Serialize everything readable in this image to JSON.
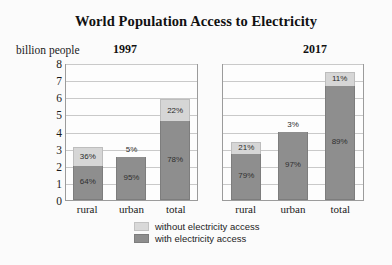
{
  "title": "World Population Access to Electricity",
  "ylabel": "billion people",
  "panels": [
    {
      "year": "1997"
    },
    {
      "year": "2017"
    }
  ],
  "legend": [
    {
      "label": "without electricity access",
      "color": "#d9d9d9"
    },
    {
      "label": "with electricity access",
      "color": "#8e8e8e"
    }
  ],
  "yticks": [
    "8",
    "7",
    "6",
    "5",
    "4",
    "3",
    "2",
    "1",
    "0"
  ],
  "categories": [
    "rural",
    "urban",
    "total"
  ],
  "labels_1997": {
    "rural_without": "36%",
    "rural_with": "64%",
    "urban_without": "5%",
    "urban_with": "95%",
    "total_without": "22%",
    "total_with": "78%"
  },
  "labels_2017": {
    "rural_without": "21%",
    "rural_with": "79%",
    "urban_without": "3%",
    "urban_with": "97%",
    "total_without": "11%",
    "total_with": "89%"
  },
  "chart_data": {
    "type": "bar",
    "subtype": "stacked",
    "title": "World Population Access to Electricity",
    "xlabel": "",
    "ylabel": "billion people",
    "ylim": [
      0,
      8
    ],
    "ytick_step": 1,
    "grid": true,
    "legend_position": "bottom-center",
    "panels": [
      {
        "name": "1997",
        "categories": [
          "rural",
          "urban",
          "total"
        ],
        "series": [
          {
            "name": "with electricity access",
            "values": [
              2.0,
              2.52,
              4.6
            ],
            "percent": [
              64,
              95,
              78
            ],
            "color": "#8e8e8e"
          },
          {
            "name": "without electricity access",
            "values": [
              1.1,
              0.13,
              1.3
            ],
            "percent": [
              36,
              5,
              22
            ],
            "color": "#d9d9d9"
          }
        ],
        "totals": [
          3.1,
          2.65,
          5.9
        ]
      },
      {
        "name": "2017",
        "categories": [
          "rural",
          "urban",
          "total"
        ],
        "series": [
          {
            "name": "with electricity access",
            "values": [
              2.69,
              3.98,
              6.68
            ],
            "percent": [
              79,
              97,
              89
            ],
            "color": "#8e8e8e"
          },
          {
            "name": "without electricity access",
            "values": [
              0.71,
              0.12,
              0.82
            ],
            "percent": [
              21,
              3,
              11
            ],
            "color": "#d9d9d9"
          }
        ],
        "totals": [
          3.4,
          4.1,
          7.5
        ]
      }
    ]
  }
}
